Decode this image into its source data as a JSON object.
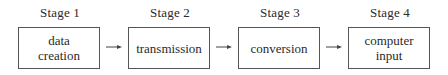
{
  "diagram": {
    "stages": [
      {
        "label": "Stage 1",
        "box_lines": [
          "data",
          "creation"
        ]
      },
      {
        "label": "Stage 2",
        "box_lines": [
          "transmission"
        ]
      },
      {
        "label": "Stage 3",
        "box_lines": [
          "conversion"
        ]
      },
      {
        "label": "Stage 4",
        "box_lines": [
          "computer",
          "input"
        ]
      }
    ],
    "arrow_icon": "right-arrow-icon",
    "colors": {
      "line": "#555555",
      "text": "#2a2a2a",
      "background": "#ffffff"
    }
  }
}
